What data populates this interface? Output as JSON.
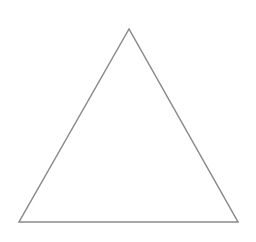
{
  "diagram": {
    "width": 256,
    "height": 242,
    "background": "#ffffff",
    "shapes": [
      {
        "type": "triangle",
        "kind": "equilateral-outline",
        "points": [
          [
            129,
            29
          ],
          [
            19,
            222
          ],
          [
            238,
            222
          ]
        ],
        "stroke": "#8a8a8a",
        "stroke_width": 1.5,
        "fill": "none"
      }
    ]
  }
}
